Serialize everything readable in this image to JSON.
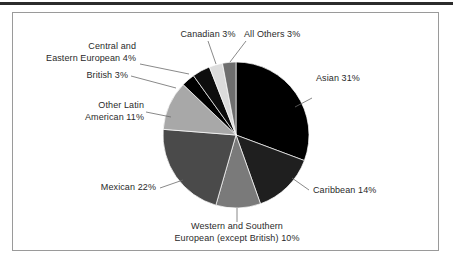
{
  "figure": {
    "title": "",
    "frame_border_color": "#9a9a9a",
    "rule_color": "#2b2b2b",
    "background": "#ffffff"
  },
  "chart_data": {
    "type": "pie",
    "title": "",
    "xlabel": "",
    "ylabel": "",
    "legend_position": "callout-labels",
    "grid": false,
    "units": "percent",
    "start_angle_deg": 0,
    "direction": "clockwise",
    "center": {
      "x": 236,
      "y": 135
    },
    "radius": 73,
    "categories": [
      "Asian",
      "Caribbean",
      "Western and Southern European (except British)",
      "Mexican",
      "Other Latin American",
      "British",
      "Central and Eastern European",
      "Canadian",
      "All Others"
    ],
    "values": [
      31,
      14,
      10,
      22,
      11,
      3,
      4,
      3,
      3
    ],
    "colors": [
      "#000000",
      "#1f1f1f",
      "#7a7a7a",
      "#4a4a4a",
      "#a8a8a8",
      "#000000",
      "#0d0d0d",
      "#dcdcdc",
      "#6e6e6e"
    ],
    "slices": [
      {
        "label": "Asian",
        "value": 31,
        "display": "Asian 31%",
        "color": "#000000"
      },
      {
        "label": "Caribbean",
        "value": 14,
        "display": "Caribbean 14%",
        "color": "#1f1f1f"
      },
      {
        "label": "Western and Southern European (except British)",
        "value": 10,
        "display": "Western and Southern European (except British) 10%",
        "color": "#7a7a7a"
      },
      {
        "label": "Mexican",
        "value": 22,
        "display": "Mexican 22%",
        "color": "#4a4a4a"
      },
      {
        "label": "Other Latin American",
        "value": 11,
        "display": "Other Latin American 11%",
        "color": "#a8a8a8"
      },
      {
        "label": "British",
        "value": 3,
        "display": "British 3%",
        "color": "#000000"
      },
      {
        "label": "Central and Eastern European",
        "value": 4,
        "display": "Central and Eastern European 4%",
        "color": "#0d0d0d"
      },
      {
        "label": "Canadian",
        "value": 3,
        "display": "Canadian 3%",
        "color": "#dcdcdc"
      },
      {
        "label": "All Others",
        "value": 3,
        "display": "All Others 3%",
        "color": "#6e6e6e"
      }
    ]
  },
  "labels": {
    "asian": "Asian 31%",
    "caribbean": "Caribbean 14%",
    "western_southern_line1": "Western and Southern",
    "western_southern_line2": "European (except British) 10%",
    "mexican": "Mexican 22%",
    "other_latin_line1": "Other Latin",
    "other_latin_line2": "American 11%",
    "british": "British 3%",
    "central_eastern_line1": "Central and",
    "central_eastern_line2": "Eastern European 4%",
    "canadian": "Canadian 3%",
    "all_others": "All Others 3%"
  }
}
